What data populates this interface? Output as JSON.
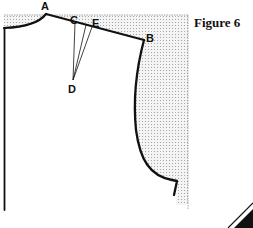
{
  "figure": {
    "title": "Figure 6",
    "points": {
      "A": "A",
      "B": "B",
      "C": "C",
      "D": "D",
      "E": "E"
    }
  },
  "colors": {
    "outline": "#111111",
    "shade_dots": "#9a9a9a",
    "background": "#ffffff"
  }
}
